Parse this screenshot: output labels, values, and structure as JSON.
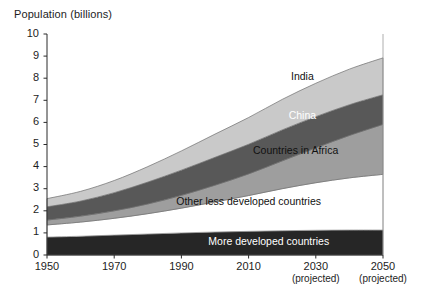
{
  "chart_data": {
    "type": "area",
    "stacked": true,
    "title": "Population (billions)",
    "xlabel": "",
    "ylabel": "Population (billions)",
    "xlim": [
      1950,
      2050
    ],
    "ylim": [
      0,
      10
    ],
    "grid": false,
    "legend_position": "inline-labels",
    "x": [
      1950,
      1960,
      1970,
      1980,
      1990,
      2000,
      2010,
      2020,
      2030,
      2040,
      2050
    ],
    "yticks": [
      0,
      1,
      2,
      3,
      4,
      5,
      6,
      7,
      8,
      9,
      10
    ],
    "ytick_labels": [
      "0",
      "1",
      "2",
      "3",
      "4",
      "5",
      "6",
      "7",
      "8",
      "9",
      "10"
    ],
    "xticks": [
      1950,
      1970,
      1990,
      2010,
      2030,
      2050
    ],
    "xtick_labels": [
      "1950",
      "1970",
      "1990",
      "2010",
      "2030",
      "2050"
    ],
    "xtick_sublabels": [
      "",
      "",
      "",
      "",
      "(projected)",
      "(projected)"
    ],
    "series": [
      {
        "name": "More developed countries",
        "color": "#262626",
        "label_color": "#ffffff",
        "values": [
          0.81,
          0.85,
          0.9,
          0.95,
          1.0,
          1.04,
          1.07,
          1.1,
          1.12,
          1.13,
          1.13
        ]
      },
      {
        "name": "Other less developed countries",
        "color": "#ffffff",
        "label_color": "#111111",
        "values": [
          0.55,
          0.64,
          0.76,
          0.92,
          1.12,
          1.36,
          1.62,
          1.9,
          2.15,
          2.36,
          2.52
        ]
      },
      {
        "name": "Countries in Africa",
        "color": "#9e9e9e",
        "label_color": "#111111",
        "values": [
          0.22,
          0.27,
          0.34,
          0.44,
          0.58,
          0.76,
          0.98,
          1.26,
          1.58,
          1.92,
          2.26
        ]
      },
      {
        "name": "China",
        "color": "#585858",
        "label_color": "#ffffff",
        "values": [
          0.6,
          0.68,
          0.82,
          0.99,
          1.14,
          1.26,
          1.34,
          1.4,
          1.41,
          1.39,
          1.34
        ]
      },
      {
        "name": "India",
        "color": "#c9c9c9",
        "label_color": "#111111",
        "values": [
          0.37,
          0.44,
          0.55,
          0.7,
          0.87,
          1.05,
          1.21,
          1.38,
          1.51,
          1.61,
          1.67
        ]
      }
    ],
    "cumulative_tops": {
      "more_developed": [
        0.81,
        0.85,
        0.9,
        0.95,
        1.0,
        1.04,
        1.07,
        1.1,
        1.12,
        1.13,
        1.13
      ],
      "other_less_dev": [
        1.36,
        1.49,
        1.66,
        1.87,
        2.12,
        2.4,
        2.69,
        3.0,
        3.27,
        3.49,
        3.65
      ],
      "africa": [
        1.58,
        1.76,
        2.0,
        2.31,
        2.7,
        3.16,
        3.67,
        4.26,
        4.85,
        5.41,
        5.91
      ],
      "china": [
        2.18,
        2.44,
        2.82,
        3.3,
        3.84,
        4.42,
        5.01,
        5.66,
        6.26,
        6.8,
        7.25
      ],
      "india": [
        2.55,
        2.88,
        3.37,
        4.0,
        4.71,
        5.47,
        6.22,
        7.04,
        7.77,
        8.41,
        8.92
      ]
    },
    "annotations": [
      {
        "text": "India",
        "x": 2026,
        "y": 8.05
      },
      {
        "text": "China",
        "x": 2026,
        "y": 6.3
      },
      {
        "text": "Countries in Africa",
        "x": 2024,
        "y": 4.7
      },
      {
        "text": "Other less developed countries",
        "x": 2010,
        "y": 2.4
      },
      {
        "text": "More developed countries",
        "x": 2016,
        "y": 0.6
      }
    ]
  },
  "axis": {
    "y_title": "Population (billions)"
  },
  "footer": {
    "note": ""
  }
}
